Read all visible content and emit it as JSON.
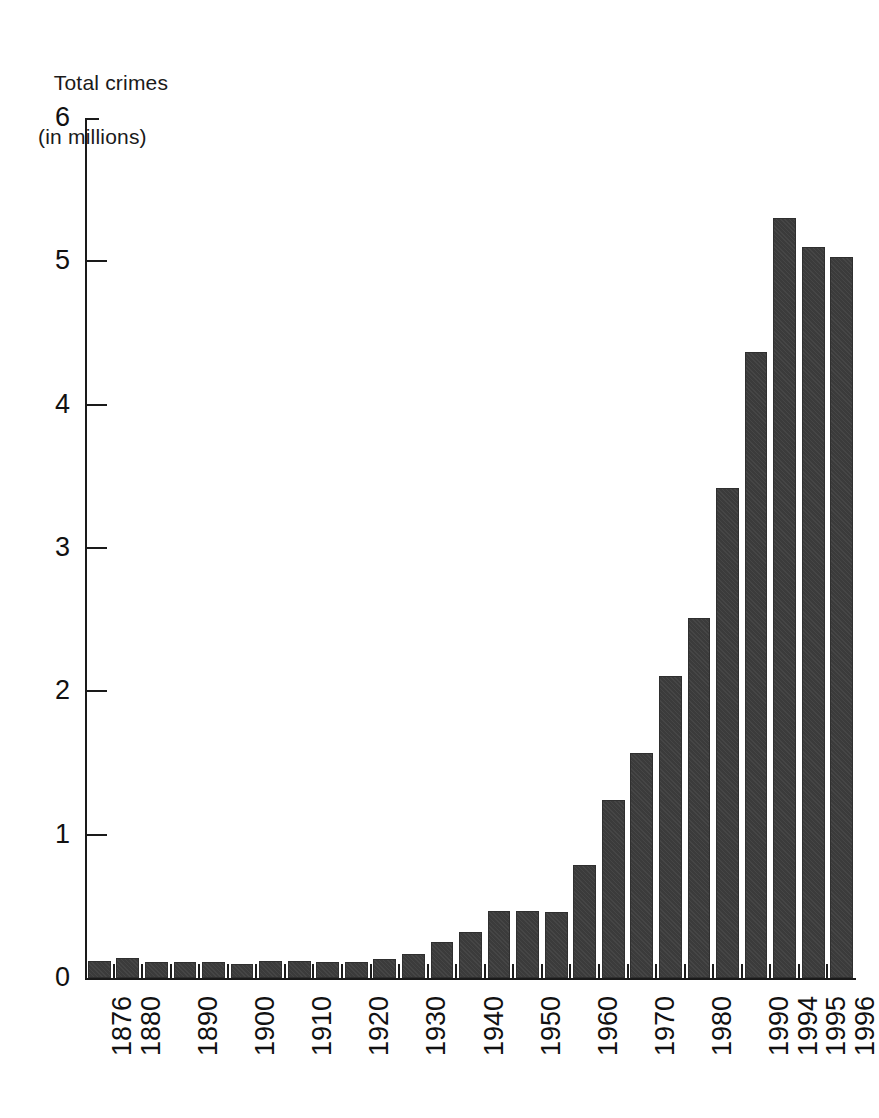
{
  "figure": {
    "y_axis_title_line1": "Total crimes",
    "y_axis_title_line2": "(in millions)"
  },
  "chart_data": {
    "type": "bar",
    "title": "Total crimes (in millions)",
    "xlabel": "",
    "ylabel": "Total crimes (in millions)",
    "ylim": [
      0,
      6
    ],
    "yticks": [
      0,
      1,
      2,
      3,
      4,
      5,
      6
    ],
    "ytick_labels": [
      "0",
      "1",
      "2",
      "3",
      "4",
      "5",
      "6"
    ],
    "grid": false,
    "legend": null,
    "bar_color": "#3b3b3b",
    "axis_color": "#1a1a1a",
    "background": "#ffffff",
    "x_tick_label_rotation": 90,
    "categories": [
      "1876",
      "1880",
      "1885",
      "1890",
      "1895",
      "1900",
      "1905",
      "1910",
      "1915",
      "1920",
      "1925",
      "1930",
      "1935",
      "1940",
      "1945",
      "1950",
      "1955",
      "1960",
      "1965",
      "1970",
      "1975",
      "1980",
      "1985",
      "1990",
      "1994",
      "1995",
      "1996"
    ],
    "labeled_categories": [
      "1876",
      "1880",
      "1890",
      "1900",
      "1910",
      "1920",
      "1930",
      "1940",
      "1950",
      "1960",
      "1970",
      "1980",
      "1990",
      "1994",
      "1995",
      "1996"
    ],
    "values": [
      0.12,
      0.14,
      0.11,
      0.11,
      0.11,
      0.1,
      0.12,
      0.12,
      0.11,
      0.11,
      0.13,
      0.17,
      0.25,
      0.32,
      0.47,
      0.47,
      0.46,
      0.79,
      1.24,
      1.57,
      2.11,
      2.51,
      3.42,
      4.37,
      5.3,
      5.1,
      5.03
    ]
  }
}
